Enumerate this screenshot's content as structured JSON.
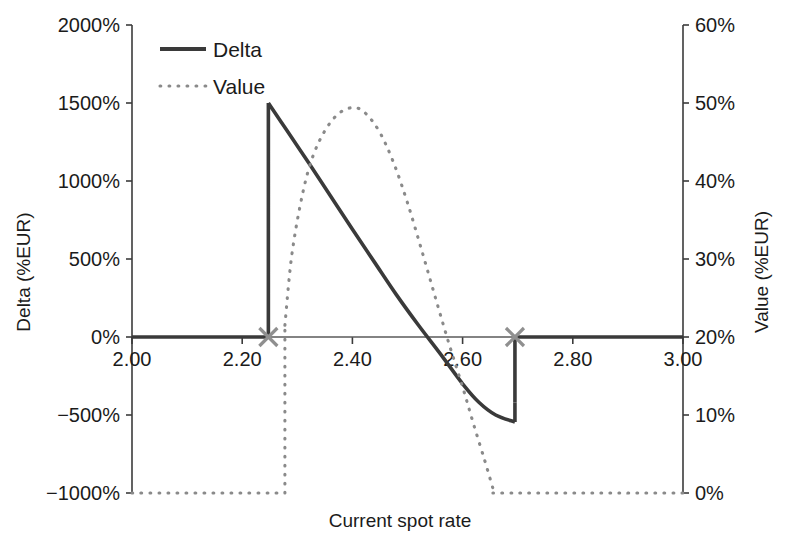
{
  "chart_data": {
    "type": "line",
    "title": "",
    "xlabel": "Current spot rate",
    "ylabel_left": "Delta (%EUR)",
    "ylabel_right": "Value (%EUR)",
    "xlim": [
      2.0,
      3.0
    ],
    "xticks": [
      2.0,
      2.2,
      2.4,
      2.6,
      2.8,
      3.0
    ],
    "xtick_labels": [
      "2.00",
      "2.20",
      "2.40",
      "2.60",
      "2.80",
      "3.00"
    ],
    "ylim_left": [
      -1000,
      2000
    ],
    "yticks_left": [
      2000,
      1500,
      1000,
      500,
      0,
      -500,
      -1000
    ],
    "ytick_labels_left": [
      "2000%",
      "1500%",
      "1000%",
      "500%",
      "0%",
      "−500%",
      "−1000%"
    ],
    "ylim_right": [
      0,
      60
    ],
    "yticks_right": [
      60,
      50,
      40,
      30,
      20,
      10,
      0
    ],
    "ytick_labels_right": [
      "60%",
      "50%",
      "40%",
      "30%",
      "20%",
      "10%",
      "0%"
    ],
    "grid": false,
    "legend_position": "upper-left",
    "legend": [
      "Delta",
      "Value"
    ],
    "series": [
      {
        "name": "Delta",
        "axis": "left",
        "style": "solid",
        "color": "#3a3a3a",
        "segments": [
          {
            "comment": "flat at zero before lower barrier",
            "x": [
              2.0,
              2.04,
              2.08,
              2.12,
              2.16,
              2.2,
              2.2475
            ],
            "y": [
              0,
              0,
              0,
              0,
              0,
              0,
              0
            ]
          },
          {
            "comment": "vertical jump at lower barrier then decaying to trough and jump back at upper barrier",
            "x": [
              2.2475,
              2.2475,
              2.28,
              2.32,
              2.36,
              2.4,
              2.44,
              2.48,
              2.52,
              2.56,
              2.6,
              2.63,
              2.66,
              2.695,
              2.695
            ],
            "y": [
              0,
              1500,
              1330,
              1120,
              905,
              690,
              480,
              270,
              75,
              -110,
              -300,
              -420,
              -500,
              -545,
              -420
            ]
          },
          {
            "comment": "jump back to zero and flat",
            "x": [
              2.695,
              2.695,
              2.74,
              2.8,
              2.86,
              2.92,
              3.0
            ],
            "y": [
              -420,
              0,
              0,
              0,
              0,
              0,
              0
            ]
          }
        ]
      },
      {
        "name": "Value",
        "axis": "right",
        "style": "dotted",
        "color": "#8a8a8a",
        "segments": [
          {
            "comment": "flat at 0% up to lower barrier",
            "x": [
              2.0,
              2.05,
              2.1,
              2.15,
              2.2,
              2.25,
              2.2775
            ],
            "y": [
              0,
              0,
              0,
              0,
              0,
              0,
              0
            ]
          },
          {
            "comment": "vertical rise at lower barrier, hump peaking near 2.41, decay to 0 near 2.66",
            "x": [
              2.2775,
              2.2775,
              2.29,
              2.31,
              2.33,
              2.355,
              2.38,
              2.405,
              2.425,
              2.45,
              2.475,
              2.5,
              2.525,
              2.55,
              2.575,
              2.6,
              2.62,
              2.64,
              2.655
            ],
            "y": [
              0,
              21.5,
              30.5,
              38.5,
              43.5,
              47.0,
              48.9,
              49.4,
              48.6,
              46.2,
              42.3,
              37.2,
              31.3,
              25.2,
              19.2,
              13.6,
              8.8,
              4.2,
              0.6
            ]
          },
          {
            "comment": "flat at 0% after upper barrier",
            "x": [
              2.655,
              2.7,
              2.75,
              2.8,
              2.85,
              2.9,
              2.95,
              3.0
            ],
            "y": [
              0,
              0,
              0,
              0,
              0,
              0,
              0,
              0
            ]
          }
        ]
      }
    ],
    "markers": [
      {
        "name": "lower-barrier-marker",
        "x": 2.2475,
        "y_left": 0,
        "symbol": "x",
        "color": "#8f8f8f"
      },
      {
        "name": "upper-barrier-marker",
        "x": 2.695,
        "y_left": 0,
        "symbol": "x",
        "color": "#8f8f8f"
      }
    ]
  }
}
